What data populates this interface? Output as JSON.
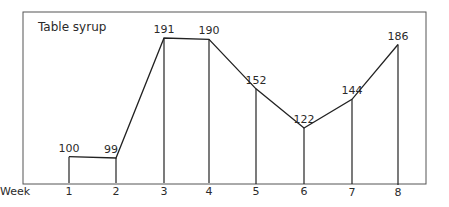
{
  "chart_data": {
    "type": "line",
    "title": "Table syrup",
    "xlabel": "Week",
    "ylabel": "",
    "categories": [
      "1",
      "2",
      "3",
      "4",
      "5",
      "6",
      "7",
      "8"
    ],
    "values": [
      100,
      99,
      191,
      190,
      152,
      122,
      144,
      186
    ],
    "data_labels": [
      "100",
      "99",
      "191",
      "190",
      "152",
      "122",
      "144",
      "186"
    ],
    "drop_lines": true,
    "grid": false,
    "legend": null,
    "ylim": [
      35,
      200
    ]
  },
  "colors": {
    "line": "#222222",
    "frame": "#555555",
    "text": "#2a2a2a",
    "background": "#ffffff"
  }
}
